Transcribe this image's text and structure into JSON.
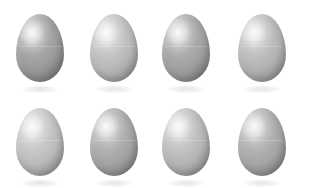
{
  "scene": {
    "title": "Eight eggs arranged in a two-by-four grid",
    "background_color": "#ffffff",
    "subject": "egg",
    "count": 8,
    "rows": 2,
    "columns": 4,
    "lighting": "soft light from upper left",
    "palette": "neutral gray"
  },
  "rows": [
    {
      "name": "top-row",
      "eggs": [
        {
          "label": "egg-1",
          "tone": "#a3a3a3",
          "shade": "medium gray"
        },
        {
          "label": "egg-2",
          "tone": "#c2c2c2",
          "shade": "light gray"
        },
        {
          "label": "egg-3",
          "tone": "#a9a9a9",
          "shade": "medium gray"
        },
        {
          "label": "egg-4",
          "tone": "#bdbdbd",
          "shade": "light gray"
        }
      ]
    },
    {
      "name": "bottom-row",
      "eggs": [
        {
          "label": "egg-5",
          "tone": "#c6c6c6",
          "shade": "light gray"
        },
        {
          "label": "egg-6",
          "tone": "#aeaeae",
          "shade": "medium gray"
        },
        {
          "label": "egg-7",
          "tone": "#c0c0c0",
          "shade": "light gray"
        },
        {
          "label": "egg-8",
          "tone": "#b0b0b0",
          "shade": "medium gray"
        }
      ]
    }
  ]
}
